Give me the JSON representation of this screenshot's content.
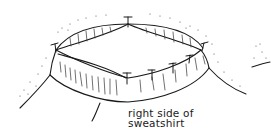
{
  "figure": {
    "label_lines": [
      "right side of",
      "sweatshirt"
    ],
    "pin_count": 7,
    "colors": {
      "ink": "#1a1a1a",
      "background": "#ffffff"
    }
  }
}
